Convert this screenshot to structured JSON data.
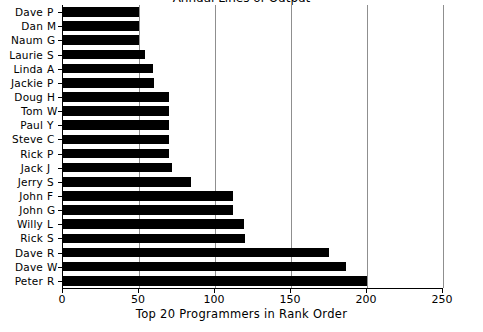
{
  "chart_data": {
    "type": "bar",
    "orientation": "horizontal",
    "title": "Annual Lines of Output",
    "title_clipped": true,
    "xlabel": "Top 20 Programmers in Rank Order",
    "ylabel": "",
    "xlim": [
      0,
      250
    ],
    "xticks": [
      0,
      50,
      100,
      150,
      200,
      250
    ],
    "xtick_labels": [
      "0",
      "50",
      "100",
      "150",
      "200",
      "250"
    ],
    "grid": "vertical",
    "legend": "none",
    "bar_color": "#000000",
    "categories": [
      "Dave P",
      "Dan M",
      "Naum G",
      "Laurie S",
      "Linda A",
      "Jackie P",
      "Doug H",
      "Tom W",
      "Paul Y",
      "Steve C",
      "Rick P",
      "Jack J",
      "Jerry S",
      "John F",
      "John G",
      "Willy L",
      "Rick S",
      "Dave R",
      "Dave W",
      "Peter R"
    ],
    "category_parts": [
      {
        "first": "Dave",
        "initial": "P"
      },
      {
        "first": "Dan",
        "initial": "M"
      },
      {
        "first": "Naum",
        "initial": "G"
      },
      {
        "first": "Laurie",
        "initial": "S"
      },
      {
        "first": "Linda",
        "initial": "A"
      },
      {
        "first": "Jackie",
        "initial": "P"
      },
      {
        "first": "Doug",
        "initial": "H"
      },
      {
        "first": "Tom",
        "initial": "W"
      },
      {
        "first": "Paul",
        "initial": "Y"
      },
      {
        "first": "Steve",
        "initial": "C"
      },
      {
        "first": "Rick",
        "initial": "P"
      },
      {
        "first": "Jack",
        "initial": "J"
      },
      {
        "first": "Jerry",
        "initial": "S"
      },
      {
        "first": "John",
        "initial": "F"
      },
      {
        "first": "John",
        "initial": "G"
      },
      {
        "first": "Willy",
        "initial": "L"
      },
      {
        "first": "Rick",
        "initial": "S"
      },
      {
        "first": "Dave",
        "initial": "R"
      },
      {
        "first": "Dave",
        "initial": "W"
      },
      {
        "first": "Peter",
        "initial": "R"
      }
    ],
    "values": [
      50,
      50,
      50,
      54,
      59,
      60,
      70,
      70,
      70,
      70,
      70,
      72,
      84,
      112,
      112,
      119,
      120,
      175,
      186,
      200
    ]
  }
}
